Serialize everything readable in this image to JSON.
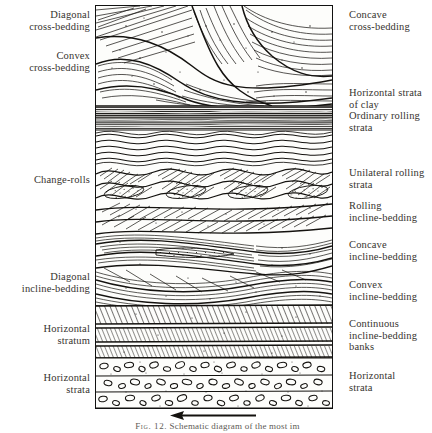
{
  "figure": {
    "caption_label": "Fig. 12.",
    "caption_text": "Schematic diagram of the most im",
    "flow_arrow_name": "current-direction-arrow"
  },
  "labels_left": [
    {
      "text": "Diagonal\ncross-bedding",
      "top": 9
    },
    {
      "text": "Convex\ncross-bedding",
      "top": 50
    },
    {
      "text": "Change-rolls",
      "top": 174
    },
    {
      "text": "Diagonal\nincline-bedding",
      "top": 271
    },
    {
      "text": "Horizontal\nstratum",
      "top": 323
    },
    {
      "text": "Horizontal\nstrata",
      "top": 372
    }
  ],
  "labels_right": [
    {
      "text": "Concave\ncross-bedding",
      "top": 9
    },
    {
      "text": "Horizontal strata\nof clay",
      "top": 87
    },
    {
      "text": "Ordinary rolling\nstrata",
      "top": 110
    },
    {
      "text": "Unilateral rolling\nstrata",
      "top": 167
    },
    {
      "text": "Rolling\nincline-bedding",
      "top": 200
    },
    {
      "text": "Concave\nincline-bedding",
      "top": 239
    },
    {
      "text": "Convex\nincline-bedding",
      "top": 279
    },
    {
      "text": "Continuous\nincline-bedding\nbanks",
      "top": 318
    },
    {
      "text": "Horizontal\nstrata",
      "top": 370
    }
  ],
  "diagram": {
    "ink_color": "#14120f",
    "paper_color": "#fdfdfb",
    "bands": [
      {
        "name": "cross-bedded-sand-upper",
        "y0": 0,
        "y1": 100,
        "pattern": "sweeping-cross-laminae"
      },
      {
        "name": "horizontal-clay-strata",
        "y0": 100,
        "y1": 124,
        "pattern": "dense-horizontal-lines"
      },
      {
        "name": "ordinary-rolling-strata",
        "y0": 124,
        "y1": 158,
        "pattern": "wavy-ripples"
      },
      {
        "name": "unilateral-rolling-strata",
        "y0": 158,
        "y1": 196,
        "pattern": "asymmetric-ripples"
      },
      {
        "name": "rolling-incline-bedding",
        "y0": 196,
        "y1": 228,
        "pattern": "inclined-lenses"
      },
      {
        "name": "concave-incline-bedding",
        "y0": 228,
        "y1": 262,
        "pattern": "concave-sets"
      },
      {
        "name": "convex-incline-bedding",
        "y0": 262,
        "y1": 300,
        "pattern": "convex-sets"
      },
      {
        "name": "continuous-incline-bedding-banks",
        "y0": 300,
        "y1": 352,
        "pattern": "diagonal-hatch-bands"
      },
      {
        "name": "horizontal-strata-conglomerate",
        "y0": 352,
        "y1": 402,
        "pattern": "pebble-conglomerate"
      }
    ]
  }
}
